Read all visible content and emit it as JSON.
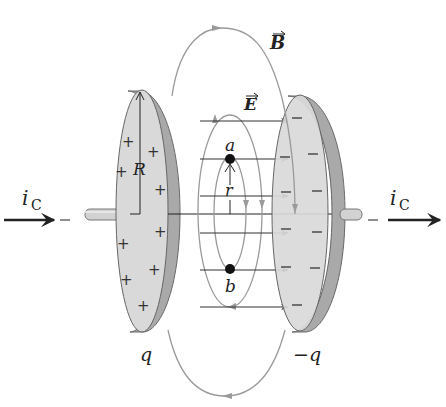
{
  "diagram": {
    "labels": {
      "magnetic_field": "B",
      "electric_field": "E",
      "point_a": "a",
      "point_b": "b",
      "radius_r": "r",
      "plate_radius": "R",
      "current_left": "i",
      "current_left_sub": "C",
      "current_right": "i",
      "current_right_sub": "C",
      "charge_left": "q",
      "charge_right": "−q",
      "plus_sign": "+",
      "minus_sign": "−"
    },
    "colors": {
      "plate_face": "#d9d9d9",
      "plate_rim": "#a9a9a9",
      "field_line_gray": "#9a9a9a",
      "e_arrow": "#333333",
      "point": "#111111",
      "wire": "#cfcfcf"
    },
    "left_plate": {
      "charge_sign": "+",
      "num_signs": 11
    },
    "right_plate": {
      "charge_sign": "−",
      "num_signs": 11
    },
    "e_field_arrows_count": 6
  }
}
